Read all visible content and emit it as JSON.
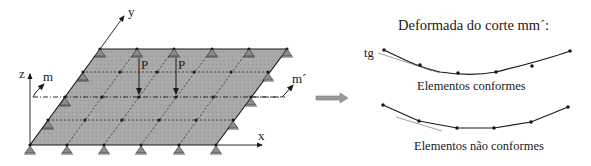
{
  "figure": {
    "left_panel": {
      "description": "Simply supported plate with finite element mesh and two point loads",
      "axes": {
        "x": "x",
        "y": "y",
        "z": "z"
      },
      "load_label_1": "P",
      "load_label_2": "P",
      "section_start": "m",
      "section_end": "m´",
      "mesh": {
        "columns": 5,
        "rows": 4
      },
      "colors": {
        "plate_fill": "#a6a6a6",
        "line": "#1a1a1a",
        "support": "#8c8c8c"
      }
    },
    "arrow": {
      "icon": "right-arrow-icon",
      "color": "#9a9a9a"
    },
    "right_panel": {
      "title": "Deformada do corte mm´:",
      "tangent_label": "tg",
      "caption_conforming": "Elementos conformes",
      "caption_nonconforming": "Elementos não conformes"
    }
  }
}
